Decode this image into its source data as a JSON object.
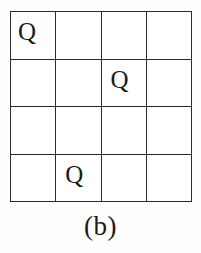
{
  "figure": {
    "caption": "(b)",
    "type": "n-queens-board",
    "board": {
      "rows": 4,
      "cols": 4,
      "piece_glyph": "Q",
      "line_color": "#2b2b2b",
      "background_color": "#ffffff",
      "text_color": "#1a1a1a",
      "cells": [
        [
          {
            "label": "Q",
            "occupied": true,
            "align": "shift-left"
          },
          {
            "label": "",
            "occupied": false,
            "align": ""
          },
          {
            "label": "",
            "occupied": false,
            "align": ""
          },
          {
            "label": "",
            "occupied": false,
            "align": ""
          }
        ],
        [
          {
            "label": "",
            "occupied": false,
            "align": ""
          },
          {
            "label": "",
            "occupied": false,
            "align": ""
          },
          {
            "label": "Q",
            "occupied": true,
            "align": "shift-mid"
          },
          {
            "label": "",
            "occupied": false,
            "align": ""
          }
        ],
        [
          {
            "label": "",
            "occupied": false,
            "align": ""
          },
          {
            "label": "",
            "occupied": false,
            "align": ""
          },
          {
            "label": "",
            "occupied": false,
            "align": ""
          },
          {
            "label": "",
            "occupied": false,
            "align": ""
          }
        ],
        [
          {
            "label": "",
            "occupied": false,
            "align": ""
          },
          {
            "label": "Q",
            "occupied": true,
            "align": "shift-mid"
          },
          {
            "label": "",
            "occupied": false,
            "align": ""
          },
          {
            "label": "",
            "occupied": false,
            "align": ""
          }
        ]
      ],
      "queen_positions": [
        {
          "row": 1,
          "col": 1
        },
        {
          "row": 2,
          "col": 3
        },
        {
          "row": 4,
          "col": 2
        }
      ]
    }
  }
}
